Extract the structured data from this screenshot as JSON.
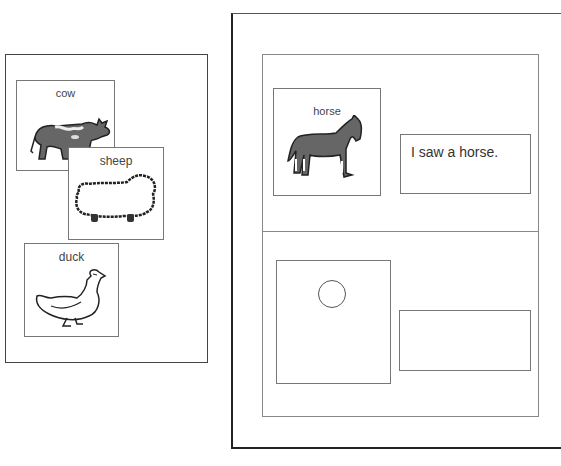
{
  "left_panel": {
    "cards": [
      {
        "label": "cow",
        "icon": "cow-icon"
      },
      {
        "label": "sheep",
        "icon": "sheep-icon"
      },
      {
        "label": "duck",
        "icon": "duck-icon"
      }
    ]
  },
  "right_panel": {
    "top_row": {
      "card": {
        "label": "horse",
        "icon": "horse-icon"
      },
      "sentence": "I saw a horse."
    },
    "bottom_row": {
      "card": {
        "label": "",
        "icon": "circle-placeholder-icon"
      },
      "sentence": ""
    }
  }
}
